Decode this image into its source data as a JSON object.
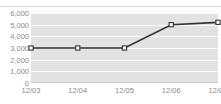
{
  "chart_title": "",
  "chart_data": {
    "type": "line",
    "title": "",
    "xlabel": "",
    "ylabel": "",
    "categories": [
      "12/03",
      "12/04",
      "12/05",
      "12/06",
      "12/07"
    ],
    "values": [
      3000,
      3000,
      3000,
      5000,
      5200
    ],
    "series": [
      {
        "name": "",
        "values": [
          3000,
          3000,
          3000,
          5000,
          5200
        ]
      }
    ],
    "ylim": [
      0,
      6000
    ],
    "y_ticks": [
      0,
      1000,
      2000,
      3000,
      4000,
      5000,
      6000
    ],
    "y_tick_labels": [
      "0",
      "1,000",
      "2,000",
      "3,000",
      "4,000",
      "5,000",
      "6,000"
    ],
    "x_tick_labels": [
      "12/03",
      "12/04",
      "12/05",
      "12/06",
      "12/07"
    ],
    "grid": true,
    "legend": false,
    "legend_position": "none",
    "marker": "open-square",
    "colors": {
      "line": "#333333",
      "marker_fill": "#ffffff",
      "marker_stroke": "#333333",
      "plot_background": "#e2e2e2",
      "gridline": "#fbfbfb",
      "axis_text": "#8b8b8b",
      "axis_line": "#c9c9c9"
    }
  }
}
